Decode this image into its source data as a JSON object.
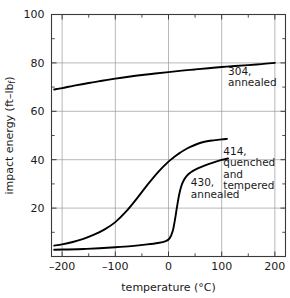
{
  "chart_data": {
    "type": "line",
    "title": "",
    "xlabel": "temperature  (°C)",
    "ylabel": "impact energy  (ft–lb",
    "ylabel_sub": "f",
    "ylabel_close": ")",
    "xlim": [
      -220,
      220
    ],
    "ylim": [
      0,
      100
    ],
    "xticks": [
      -200,
      -100,
      0,
      100,
      200
    ],
    "xtick_labels": [
      "–200",
      "–100",
      "0",
      "100",
      "200"
    ],
    "xminor": [
      -150,
      -50,
      50,
      150
    ],
    "yticks": [
      0,
      20,
      40,
      60,
      80,
      100
    ],
    "ytick_labels": [
      "0",
      "20",
      "40",
      "60",
      "80",
      "100"
    ],
    "ytick_labels_shown": [
      "20",
      "40",
      "60",
      "80",
      "100"
    ],
    "yminor": [
      10,
      30,
      50,
      70,
      90
    ],
    "grid": true,
    "grid_color": "#9a9a9a",
    "axis_color": "#3a3a3a",
    "curve_color": "#000000",
    "legend_position": "inline-annotations",
    "series": [
      {
        "name": "304, annealed",
        "label_lines": [
          "304,",
          "annealed"
        ],
        "label_x": 112,
        "label_y": 75,
        "x": [
          -215,
          -200,
          -175,
          -150,
          -125,
          -100,
          -75,
          -50,
          -25,
          0,
          25,
          50,
          75,
          100,
          125,
          150,
          175,
          200
        ],
        "y": [
          69.0,
          69.6,
          70.7,
          71.7,
          72.6,
          73.5,
          74.3,
          75.0,
          75.6,
          76.2,
          76.8,
          77.3,
          77.8,
          78.3,
          78.7,
          79.1,
          79.5,
          80.0
        ]
      },
      {
        "name": "414, quenched and tempered",
        "label_lines": [
          "414,",
          "quenched",
          "and",
          "tempered"
        ],
        "label_x": 103,
        "label_y": 42,
        "x": [
          -215,
          -200,
          -180,
          -160,
          -140,
          -120,
          -100,
          -80,
          -60,
          -40,
          -20,
          0,
          10,
          20,
          30,
          40,
          55,
          70,
          85,
          100,
          110
        ],
        "y": [
          4.5,
          5.0,
          6.0,
          7.3,
          9.0,
          11.2,
          14.2,
          18.5,
          23.8,
          29.5,
          34.8,
          39.2,
          41.0,
          42.6,
          44.0,
          45.2,
          46.6,
          47.5,
          48.0,
          48.4,
          48.6
        ]
      },
      {
        "name": "430, annealed",
        "label_lines": [
          "430,",
          "annealed"
        ],
        "label_x": 42,
        "label_y": 29,
        "x": [
          -215,
          -190,
          -160,
          -130,
          -100,
          -70,
          -40,
          -20,
          -5,
          2,
          8,
          12,
          16,
          20,
          24,
          28,
          34,
          42,
          55,
          70,
          85,
          100,
          112
        ],
        "y": [
          2.8,
          2.9,
          3.1,
          3.4,
          3.8,
          4.3,
          5.0,
          5.6,
          6.4,
          7.5,
          10.5,
          15.0,
          20.5,
          25.5,
          29.0,
          31.2,
          33.2,
          34.8,
          36.4,
          37.8,
          38.9,
          39.9,
          40.5
        ]
      }
    ]
  }
}
